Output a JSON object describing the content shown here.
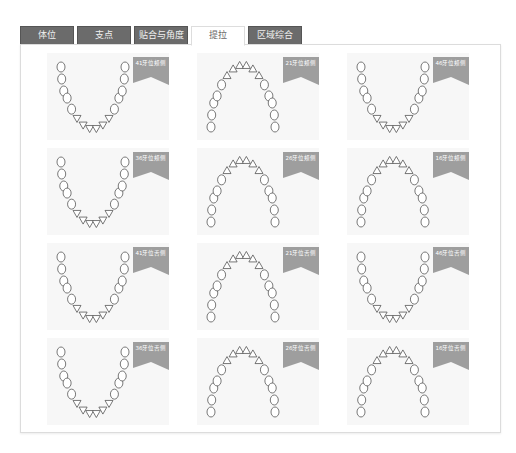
{
  "tabs": [
    {
      "label": "体位",
      "active": false
    },
    {
      "label": "支点",
      "active": false
    },
    {
      "label": "贴合与角度",
      "active": false
    },
    {
      "label": "提拉",
      "active": true
    },
    {
      "label": "区域综合",
      "active": false
    }
  ],
  "cards": [
    {
      "label": "41牙位颊侧",
      "arch": "lower"
    },
    {
      "label": "21牙位颊侧",
      "arch": "upper"
    },
    {
      "label": "46牙位颊侧",
      "arch": "lower"
    },
    {
      "label": "36牙位颊侧",
      "arch": "lower"
    },
    {
      "label": "26牙位颊侧",
      "arch": "upper"
    },
    {
      "label": "16牙位颊侧",
      "arch": "upper"
    },
    {
      "label": "41牙位舌侧",
      "arch": "lower"
    },
    {
      "label": "21牙位舌侧",
      "arch": "upper"
    },
    {
      "label": "46牙位舌侧",
      "arch": "lower"
    },
    {
      "label": "36牙位舌侧",
      "arch": "lower"
    },
    {
      "label": "26牙位舌侧",
      "arch": "upper"
    },
    {
      "label": "16牙位舌侧",
      "arch": "upper"
    }
  ],
  "colors": {
    "tab_bg": "#6b6b6b",
    "ribbon": "#9e9e9e",
    "card_bg": "#f7f7f7"
  }
}
